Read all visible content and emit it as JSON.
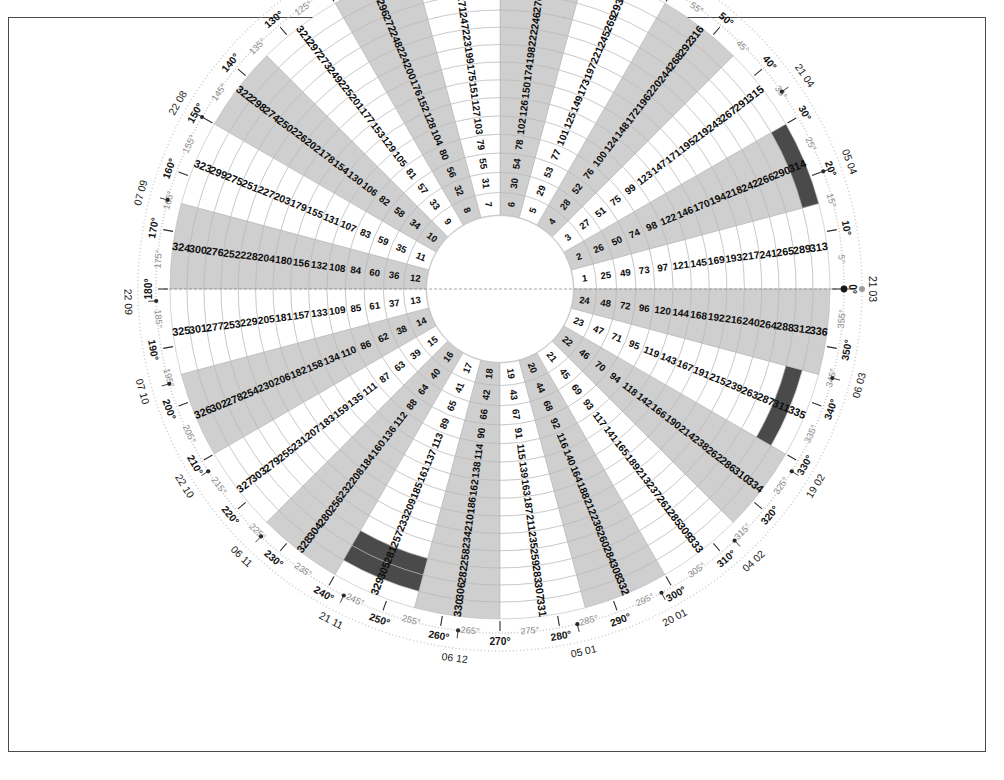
{
  "figure": {
    "type": "polar-grid",
    "title": "",
    "n_spokes": 24,
    "n_rings": 14,
    "total_cells": 336,
    "spoke_width_deg": 15,
    "start_angle_deg": 0,
    "direction": "counter-clockwise",
    "value_formula": "(ring-1)*24 + spoke",
    "inner_radius_px": 74,
    "outer_radius_px": 330,
    "center_x": 500,
    "center_y": 289
  },
  "colors": {
    "sector_shaded": "#cfcfcf",
    "sector_plain": "#ffffff",
    "highlight": "#4a4a4a",
    "grid_line": "#b4b4b4",
    "ring_line": "#a8a8a8",
    "outer_ring": "#c8c8c8",
    "text": "#0d0d0d",
    "deg_major": "#141414",
    "deg_minor": "#8a8a8a",
    "frame": "#4a4a4a"
  },
  "chart_data": {
    "type": "heatmap",
    "title": "",
    "xlabel": "",
    "ylabel": "",
    "categories": [
      "1",
      "2",
      "3",
      "4",
      "5",
      "6",
      "7",
      "8",
      "9",
      "10",
      "11",
      "12",
      "13",
      "14",
      "15",
      "16",
      "17",
      "18",
      "19",
      "20",
      "21",
      "22",
      "23",
      "24"
    ],
    "rings": [
      1,
      2,
      3,
      4,
      5,
      6,
      7,
      8,
      9,
      10,
      11,
      12,
      13,
      14
    ],
    "series": [
      {
        "name": "ring-1",
        "values": [
          1,
          2,
          3,
          4,
          5,
          6,
          7,
          8,
          9,
          10,
          11,
          12,
          13,
          14,
          15,
          16,
          17,
          18,
          19,
          20,
          21,
          22,
          23,
          24
        ]
      },
      {
        "name": "ring-2",
        "values": [
          25,
          26,
          27,
          28,
          29,
          30,
          31,
          32,
          33,
          34,
          35,
          36,
          37,
          38,
          39,
          40,
          41,
          42,
          43,
          44,
          45,
          46,
          47,
          48
        ]
      },
      {
        "name": "ring-3",
        "values": [
          49,
          50,
          51,
          52,
          53,
          54,
          55,
          56,
          57,
          58,
          59,
          60,
          61,
          62,
          63,
          64,
          65,
          66,
          67,
          68,
          69,
          70,
          71,
          72
        ]
      },
      {
        "name": "ring-4",
        "values": [
          73,
          74,
          75,
          76,
          77,
          78,
          79,
          80,
          81,
          82,
          83,
          84,
          85,
          86,
          87,
          88,
          89,
          90,
          91,
          92,
          93,
          94,
          95,
          96
        ]
      },
      {
        "name": "ring-5",
        "values": [
          97,
          98,
          99,
          100,
          101,
          102,
          103,
          104,
          105,
          106,
          107,
          108,
          109,
          110,
          111,
          112,
          113,
          114,
          115,
          116,
          117,
          118,
          119,
          120
        ]
      },
      {
        "name": "ring-6",
        "values": [
          121,
          122,
          123,
          124,
          125,
          126,
          127,
          128,
          129,
          130,
          131,
          132,
          133,
          134,
          135,
          136,
          137,
          138,
          139,
          140,
          141,
          142,
          143,
          144
        ]
      },
      {
        "name": "ring-7",
        "values": [
          145,
          146,
          147,
          148,
          149,
          150,
          151,
          152,
          153,
          154,
          155,
          156,
          157,
          158,
          159,
          160,
          161,
          162,
          163,
          164,
          165,
          166,
          167,
          168
        ]
      },
      {
        "name": "ring-8",
        "values": [
          169,
          170,
          171,
          172,
          173,
          174,
          175,
          176,
          177,
          178,
          179,
          180,
          181,
          182,
          183,
          184,
          185,
          186,
          187,
          188,
          189,
          190,
          191,
          192
        ]
      },
      {
        "name": "ring-9",
        "values": [
          193,
          194,
          195,
          196,
          197,
          198,
          199,
          200,
          201,
          202,
          203,
          204,
          205,
          206,
          207,
          208,
          209,
          210,
          211,
          212,
          213,
          214,
          215,
          216
        ]
      },
      {
        "name": "ring-10",
        "values": [
          217,
          218,
          219,
          220,
          221,
          222,
          223,
          224,
          225,
          226,
          227,
          228,
          229,
          230,
          231,
          232,
          233,
          234,
          235,
          236,
          237,
          238,
          239,
          240
        ]
      },
      {
        "name": "ring-11",
        "values": [
          241,
          242,
          243,
          244,
          245,
          246,
          247,
          248,
          249,
          250,
          251,
          252,
          253,
          254,
          255,
          256,
          257,
          258,
          259,
          260,
          261,
          262,
          263,
          264
        ]
      },
      {
        "name": "ring-12",
        "values": [
          265,
          266,
          267,
          268,
          269,
          270,
          271,
          272,
          273,
          274,
          275,
          276,
          277,
          278,
          279,
          280,
          281,
          282,
          283,
          284,
          285,
          286,
          287,
          288
        ]
      },
      {
        "name": "ring-13",
        "values": [
          289,
          290,
          291,
          292,
          293,
          294,
          295,
          296,
          297,
          298,
          299,
          300,
          301,
          302,
          303,
          304,
          305,
          306,
          307,
          308,
          309,
          310,
          311,
          312
        ]
      },
      {
        "name": "ring-14",
        "values": [
          313,
          314,
          315,
          316,
          317,
          318,
          319,
          320,
          321,
          322,
          323,
          324,
          325,
          326,
          327,
          328,
          329,
          330,
          331,
          332,
          333,
          334,
          335,
          336
        ]
      }
    ],
    "shaded_spokes": [
      2,
      4,
      6,
      8,
      10,
      12,
      14,
      16,
      18,
      20,
      22,
      24
    ],
    "highlighted_cells": [
      314,
      281,
      305,
      311
    ],
    "grid": true,
    "legend": "none"
  },
  "degree_axis": {
    "unit": "°",
    "step": 5,
    "major_step": 10,
    "ticks": [
      {
        "deg": 0,
        "label": "0°",
        "major": true
      },
      {
        "deg": 5,
        "label": "5°",
        "major": false
      },
      {
        "deg": 10,
        "label": "10°",
        "major": true
      },
      {
        "deg": 15,
        "label": "15°",
        "major": false
      },
      {
        "deg": 20,
        "label": "20°",
        "major": true
      },
      {
        "deg": 25,
        "label": "25°",
        "major": false
      },
      {
        "deg": 30,
        "label": "30°",
        "major": true
      },
      {
        "deg": 35,
        "label": "35°",
        "major": false
      },
      {
        "deg": 40,
        "label": "40°",
        "major": true
      },
      {
        "deg": 45,
        "label": "45°",
        "major": false
      },
      {
        "deg": 50,
        "label": "50°",
        "major": true
      },
      {
        "deg": 55,
        "label": "55°",
        "major": false
      },
      {
        "deg": 60,
        "label": "60°",
        "major": true
      },
      {
        "deg": 65,
        "label": "65°",
        "major": false
      },
      {
        "deg": 70,
        "label": "70°",
        "major": true
      },
      {
        "deg": 75,
        "label": "75°",
        "major": false
      },
      {
        "deg": 80,
        "label": "80°",
        "major": true
      },
      {
        "deg": 85,
        "label": "85°",
        "major": false
      },
      {
        "deg": 90,
        "label": "90°",
        "major": true
      },
      {
        "deg": 95,
        "label": "95°",
        "major": false
      },
      {
        "deg": 100,
        "label": "100°",
        "major": true
      },
      {
        "deg": 105,
        "label": "105°",
        "major": false
      },
      {
        "deg": 110,
        "label": "110°",
        "major": true
      },
      {
        "deg": 115,
        "label": "115°",
        "major": false
      },
      {
        "deg": 120,
        "label": "120°",
        "major": true
      },
      {
        "deg": 125,
        "label": "125°",
        "major": false
      },
      {
        "deg": 130,
        "label": "130°",
        "major": true
      },
      {
        "deg": 135,
        "label": "135°",
        "major": false
      },
      {
        "deg": 140,
        "label": "140°",
        "major": true
      },
      {
        "deg": 145,
        "label": "145°",
        "major": false
      },
      {
        "deg": 150,
        "label": "150°",
        "major": true
      },
      {
        "deg": 155,
        "label": "155°",
        "major": false
      },
      {
        "deg": 160,
        "label": "160°",
        "major": true
      },
      {
        "deg": 165,
        "label": "165°",
        "major": false
      },
      {
        "deg": 170,
        "label": "170°",
        "major": true
      },
      {
        "deg": 175,
        "label": "175°",
        "major": false
      },
      {
        "deg": 180,
        "label": "180°",
        "major": true
      },
      {
        "deg": 185,
        "label": "185°",
        "major": false
      },
      {
        "deg": 190,
        "label": "190°",
        "major": true
      },
      {
        "deg": 195,
        "label": "195°",
        "major": false
      },
      {
        "deg": 200,
        "label": "200°",
        "major": true
      },
      {
        "deg": 205,
        "label": "205°",
        "major": false
      },
      {
        "deg": 210,
        "label": "210°",
        "major": true
      },
      {
        "deg": 215,
        "label": "215°",
        "major": false
      },
      {
        "deg": 220,
        "label": "220°",
        "major": true
      },
      {
        "deg": 225,
        "label": "225°",
        "major": false
      },
      {
        "deg": 230,
        "label": "230°",
        "major": true
      },
      {
        "deg": 235,
        "label": "235°",
        "major": false
      },
      {
        "deg": 240,
        "label": "240°",
        "major": true
      },
      {
        "deg": 245,
        "label": "245°",
        "major": false
      },
      {
        "deg": 250,
        "label": "250°",
        "major": true
      },
      {
        "deg": 255,
        "label": "255°",
        "major": false
      },
      {
        "deg": 260,
        "label": "260°",
        "major": true
      },
      {
        "deg": 265,
        "label": "265°",
        "major": false
      },
      {
        "deg": 270,
        "label": "270°",
        "major": true
      },
      {
        "deg": 275,
        "label": "275°",
        "major": false
      },
      {
        "deg": 280,
        "label": "280°",
        "major": true
      },
      {
        "deg": 285,
        "label": "285°",
        "major": false
      },
      {
        "deg": 290,
        "label": "290°",
        "major": true
      },
      {
        "deg": 295,
        "label": "295°",
        "major": false
      },
      {
        "deg": 300,
        "label": "300°",
        "major": true
      },
      {
        "deg": 305,
        "label": "305°",
        "major": false
      },
      {
        "deg": 310,
        "label": "310°",
        "major": true
      },
      {
        "deg": 315,
        "label": "315°",
        "major": false
      },
      {
        "deg": 320,
        "label": "320°",
        "major": true
      },
      {
        "deg": 325,
        "label": "325°",
        "major": false
      },
      {
        "deg": 330,
        "label": "330°",
        "major": true
      },
      {
        "deg": 335,
        "label": "335°",
        "major": false
      },
      {
        "deg": 340,
        "label": "340°",
        "major": true
      },
      {
        "deg": 345,
        "label": "345°",
        "major": false
      },
      {
        "deg": 350,
        "label": "350°",
        "major": true
      },
      {
        "deg": 355,
        "label": "355°",
        "major": false
      }
    ]
  },
  "date_axis": {
    "labels": [
      {
        "deg": 0,
        "label": "21 03"
      },
      {
        "deg": 20,
        "label": "05 04"
      },
      {
        "deg": 35,
        "label": "21 04"
      },
      {
        "deg": 150,
        "label": "22 08"
      },
      {
        "deg": 165,
        "label": "07 09"
      },
      {
        "deg": 182,
        "label": "22 09"
      },
      {
        "deg": 196,
        "label": "07 10"
      },
      {
        "deg": 212,
        "label": "22 10"
      },
      {
        "deg": 226,
        "label": "06 11"
      },
      {
        "deg": 243,
        "label": "21 11"
      },
      {
        "deg": 263,
        "label": "06 12"
      },
      {
        "deg": 283,
        "label": "05 01"
      },
      {
        "deg": 298,
        "label": "20 01"
      },
      {
        "deg": 313,
        "label": "04 02"
      },
      {
        "deg": 328,
        "label": "19 02"
      },
      {
        "deg": 345,
        "label": "06 03"
      }
    ]
  }
}
